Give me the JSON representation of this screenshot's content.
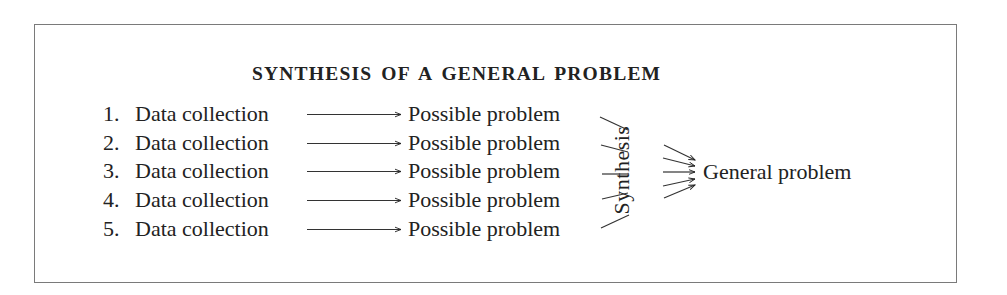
{
  "title": "SYNTHESIS OF A GENERAL PROBLEM",
  "rows": [
    {
      "number": "1.",
      "source": "Data collection",
      "target": "Possible problem"
    },
    {
      "number": "2.",
      "source": "Data collection",
      "target": "Possible problem"
    },
    {
      "number": "3.",
      "source": "Data collection",
      "target": "Possible problem"
    },
    {
      "number": "4.",
      "source": "Data collection",
      "target": "Possible problem"
    },
    {
      "number": "5.",
      "source": "Data collection",
      "target": "Possible problem"
    }
  ],
  "synthesis_label": "Synthesis",
  "result_label": "General problem",
  "colors": {
    "text": "#222222",
    "border": "#7a7a7a",
    "background": "#ffffff"
  }
}
